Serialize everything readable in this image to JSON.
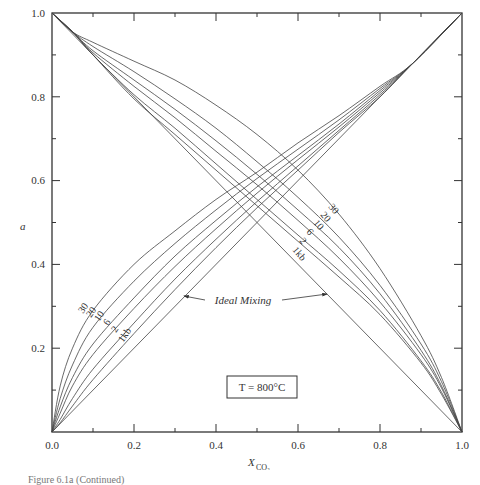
{
  "chart_data": {
    "type": "line",
    "title": "",
    "xlabel": "X_CO2",
    "ylabel": "a",
    "xlim": [
      0,
      1
    ],
    "ylim": [
      0,
      1
    ],
    "grid": false,
    "x_ticks": [
      "0.0",
      "0.2",
      "0.4",
      "0.6",
      "0.8",
      "1.0"
    ],
    "y_ticks": [
      "0.2",
      "0.4",
      "0.6",
      "0.8",
      "1.0"
    ],
    "annotations": {
      "ideal_mixing": "Ideal Mixing",
      "temperature_box": "T = 800°C"
    },
    "pressure_labels": [
      "30",
      "20",
      "10",
      "6",
      "2",
      "1kb"
    ],
    "series": [
      {
        "name": "a_CO2 30 kb",
        "x": [
          0,
          0.02,
          0.05,
          0.1,
          0.2,
          0.3,
          0.4,
          0.5,
          0.6,
          0.7,
          0.8,
          0.88,
          1.0
        ],
        "y": [
          0,
          0.11,
          0.2,
          0.29,
          0.4,
          0.48,
          0.555,
          0.62,
          0.69,
          0.755,
          0.825,
          0.88,
          1.0
        ]
      },
      {
        "name": "a_CO2 20 kb",
        "x": [
          0,
          0.02,
          0.05,
          0.1,
          0.2,
          0.3,
          0.4,
          0.5,
          0.6,
          0.7,
          0.8,
          0.88,
          1.0
        ],
        "y": [
          0,
          0.08,
          0.16,
          0.25,
          0.36,
          0.45,
          0.53,
          0.605,
          0.675,
          0.745,
          0.82,
          0.88,
          1.0
        ]
      },
      {
        "name": "a_CO2 10 kb",
        "x": [
          0,
          0.02,
          0.05,
          0.1,
          0.2,
          0.3,
          0.4,
          0.5,
          0.6,
          0.7,
          0.8,
          0.88,
          1.0
        ],
        "y": [
          0,
          0.06,
          0.13,
          0.21,
          0.32,
          0.42,
          0.505,
          0.585,
          0.66,
          0.735,
          0.815,
          0.88,
          1.0
        ]
      },
      {
        "name": "a_CO2 6 kb",
        "x": [
          0,
          0.02,
          0.05,
          0.1,
          0.2,
          0.3,
          0.4,
          0.5,
          0.6,
          0.7,
          0.8,
          0.88,
          1.0
        ],
        "y": [
          0,
          0.045,
          0.11,
          0.185,
          0.295,
          0.395,
          0.485,
          0.57,
          0.65,
          0.728,
          0.81,
          0.88,
          1.0
        ]
      },
      {
        "name": "a_CO2 2 kb",
        "x": [
          0,
          0.02,
          0.05,
          0.1,
          0.2,
          0.3,
          0.4,
          0.5,
          0.6,
          0.7,
          0.8,
          0.88,
          1.0
        ],
        "y": [
          0,
          0.03,
          0.08,
          0.15,
          0.26,
          0.365,
          0.46,
          0.55,
          0.635,
          0.72,
          0.805,
          0.88,
          1.0
        ]
      },
      {
        "name": "a_CO2 1 kb",
        "x": [
          0,
          0.02,
          0.05,
          0.1,
          0.2,
          0.3,
          0.4,
          0.5,
          0.6,
          0.7,
          0.8,
          0.88,
          1.0
        ],
        "y": [
          0,
          0.022,
          0.062,
          0.125,
          0.235,
          0.34,
          0.44,
          0.535,
          0.625,
          0.715,
          0.8,
          0.88,
          1.0
        ]
      },
      {
        "name": "a_CO2 ideal",
        "x": [
          0,
          1
        ],
        "y": [
          0,
          1
        ]
      },
      {
        "name": "a_H2O 30 kb",
        "x": [
          0,
          0.05,
          0.1,
          0.2,
          0.3,
          0.4,
          0.5,
          0.6,
          0.7,
          0.8,
          0.9,
          0.95,
          1.0
        ],
        "y": [
          1.0,
          0.955,
          0.93,
          0.885,
          0.84,
          0.78,
          0.71,
          0.625,
          0.52,
          0.39,
          0.23,
          0.13,
          0
        ]
      },
      {
        "name": "a_H2O 20 kb",
        "x": [
          0,
          0.05,
          0.1,
          0.2,
          0.3,
          0.4,
          0.5,
          0.6,
          0.7,
          0.8,
          0.9,
          0.95,
          1.0
        ],
        "y": [
          1.0,
          0.955,
          0.92,
          0.86,
          0.795,
          0.725,
          0.645,
          0.56,
          0.465,
          0.35,
          0.21,
          0.12,
          0
        ]
      },
      {
        "name": "a_H2O 10 kb",
        "x": [
          0,
          0.05,
          0.1,
          0.2,
          0.3,
          0.4,
          0.5,
          0.6,
          0.7,
          0.8,
          0.9,
          0.95,
          1.0
        ],
        "y": [
          1.0,
          0.955,
          0.91,
          0.84,
          0.77,
          0.695,
          0.615,
          0.53,
          0.44,
          0.33,
          0.195,
          0.11,
          0
        ]
      },
      {
        "name": "a_H2O 6 kb",
        "x": [
          0,
          0.05,
          0.1,
          0.2,
          0.3,
          0.4,
          0.5,
          0.6,
          0.7,
          0.8,
          0.9,
          0.95,
          1.0
        ],
        "y": [
          1.0,
          0.955,
          0.905,
          0.825,
          0.75,
          0.67,
          0.59,
          0.505,
          0.415,
          0.31,
          0.185,
          0.105,
          0
        ]
      },
      {
        "name": "a_H2O 2 kb",
        "x": [
          0,
          0.05,
          0.1,
          0.2,
          0.3,
          0.4,
          0.5,
          0.6,
          0.7,
          0.8,
          0.9,
          0.95,
          1.0
        ],
        "y": [
          1.0,
          0.955,
          0.9,
          0.805,
          0.725,
          0.64,
          0.555,
          0.47,
          0.385,
          0.29,
          0.17,
          0.095,
          0
        ]
      },
      {
        "name": "a_H2O 1 kb",
        "x": [
          0,
          0.05,
          0.1,
          0.2,
          0.3,
          0.4,
          0.5,
          0.6,
          0.7,
          0.8,
          0.9,
          0.95,
          1.0
        ],
        "y": [
          1.0,
          0.955,
          0.9,
          0.795,
          0.71,
          0.625,
          0.54,
          0.455,
          0.37,
          0.28,
          0.165,
          0.09,
          0
        ]
      },
      {
        "name": "a_H2O ideal",
        "x": [
          0,
          1
        ],
        "y": [
          1,
          0
        ]
      }
    ]
  },
  "caption": "Figure 6.1a (Continued)"
}
